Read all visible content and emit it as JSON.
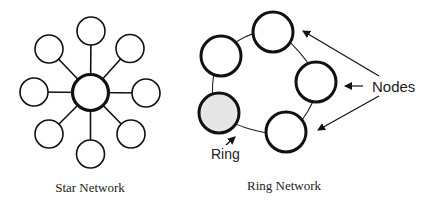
{
  "star": {
    "caption": "Star Network",
    "hub": {
      "cx": 90.5,
      "cy": 92.5,
      "r": 18
    },
    "nodes": [
      {
        "cx": 91,
        "cy": 31
      },
      {
        "cx": 130,
        "cy": 48.5
      },
      {
        "cx": 146,
        "cy": 93
      },
      {
        "cx": 131,
        "cy": 134
      },
      {
        "cx": 90.5,
        "cy": 154
      },
      {
        "cx": 49,
        "cy": 134
      },
      {
        "cx": 34,
        "cy": 92
      },
      {
        "cx": 49,
        "cy": 49
      }
    ],
    "node_radius": 14
  },
  "ring": {
    "caption": "Ring Network",
    "nodes_label": "Nodes",
    "ring_label": "Ring",
    "nodes": [
      {
        "cx": 273,
        "cy": 32,
        "shaded": false
      },
      {
        "cx": 316,
        "cy": 82,
        "shaded": false
      },
      {
        "cx": 286,
        "cy": 132,
        "shaded": false
      },
      {
        "cx": 219,
        "cy": 113,
        "shaded": true
      },
      {
        "cx": 221,
        "cy": 56,
        "shaded": false
      }
    ],
    "node_radius": 20,
    "shaded_fill": "#e6e6e6"
  },
  "colors": {
    "stroke": "#111111",
    "text": "#222222",
    "background": "#ffffff"
  }
}
